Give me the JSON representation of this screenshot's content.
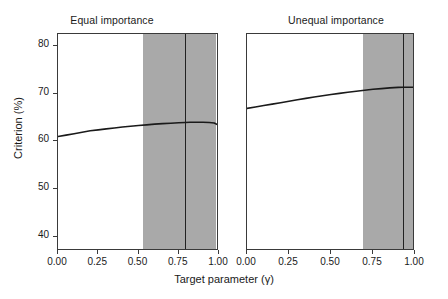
{
  "chart_data": {
    "type": "line",
    "title": "",
    "xlabel": "Target parameter (γ)",
    "ylabel": "Criterion (%)",
    "xlim": [
      0.0,
      1.0
    ],
    "ylim": [
      37.0,
      82.5
    ],
    "xticks": [
      0.0,
      0.25,
      0.5,
      0.75,
      1.0
    ],
    "xticklabels": [
      "0.00",
      "0.25",
      "0.50",
      "0.75",
      "1.00"
    ],
    "yticks": [
      40,
      50,
      60,
      70,
      80
    ],
    "yticklabels": [
      "40",
      "50",
      "60",
      "70",
      "80"
    ],
    "grid": false,
    "legend": "none",
    "panels": [
      {
        "id": "equal-importance",
        "title": "Equal importance",
        "shaded_region": {
          "x_start": 0.53,
          "x_end": 0.98,
          "color": "#a9a9a9",
          "label": "uncertainty band"
        },
        "vertical_line": {
          "x": 0.79,
          "color": "#222222",
          "label": "optimum"
        },
        "series": [
          {
            "name": "criterion",
            "color": "#1a1a1a",
            "x": [
              0.0,
              0.05,
              0.1,
              0.15,
              0.2,
              0.25,
              0.3,
              0.35,
              0.4,
              0.45,
              0.5,
              0.55,
              0.6,
              0.65,
              0.7,
              0.75,
              0.79,
              0.82,
              0.86,
              0.9,
              0.94,
              0.97,
              0.99,
              1.0
            ],
            "y": [
              61.0,
              61.3,
              61.6,
              61.9,
              62.2,
              62.4,
              62.6,
              62.8,
              63.0,
              63.15,
              63.3,
              63.45,
              63.6,
              63.7,
              63.8,
              63.9,
              63.95,
              64.0,
              64.0,
              64.0,
              63.95,
              63.85,
              63.5,
              63.2
            ]
          }
        ]
      },
      {
        "id": "unequal-importance",
        "title": "Unequal importance",
        "shaded_region": {
          "x_start": 0.69,
          "x_end": 1.0,
          "color": "#a9a9a9",
          "label": "uncertainty band"
        },
        "vertical_line": {
          "x": 0.93,
          "color": "#222222",
          "label": "optimum"
        },
        "series": [
          {
            "name": "criterion",
            "color": "#1a1a1a",
            "x": [
              0.0,
              0.05,
              0.1,
              0.15,
              0.2,
              0.25,
              0.3,
              0.35,
              0.4,
              0.45,
              0.5,
              0.55,
              0.6,
              0.65,
              0.7,
              0.75,
              0.8,
              0.85,
              0.9,
              0.93,
              0.96,
              0.98,
              1.0
            ],
            "y": [
              66.9,
              67.2,
              67.5,
              67.8,
              68.1,
              68.4,
              68.7,
              69.0,
              69.3,
              69.55,
              69.8,
              70.05,
              70.3,
              70.5,
              70.7,
              70.9,
              71.05,
              71.2,
              71.3,
              71.35,
              71.35,
              71.35,
              71.3
            ]
          }
        ]
      }
    ]
  },
  "figure": {
    "ylabel": "Criterion (%)",
    "xlabel": "Target parameter (γ)"
  }
}
